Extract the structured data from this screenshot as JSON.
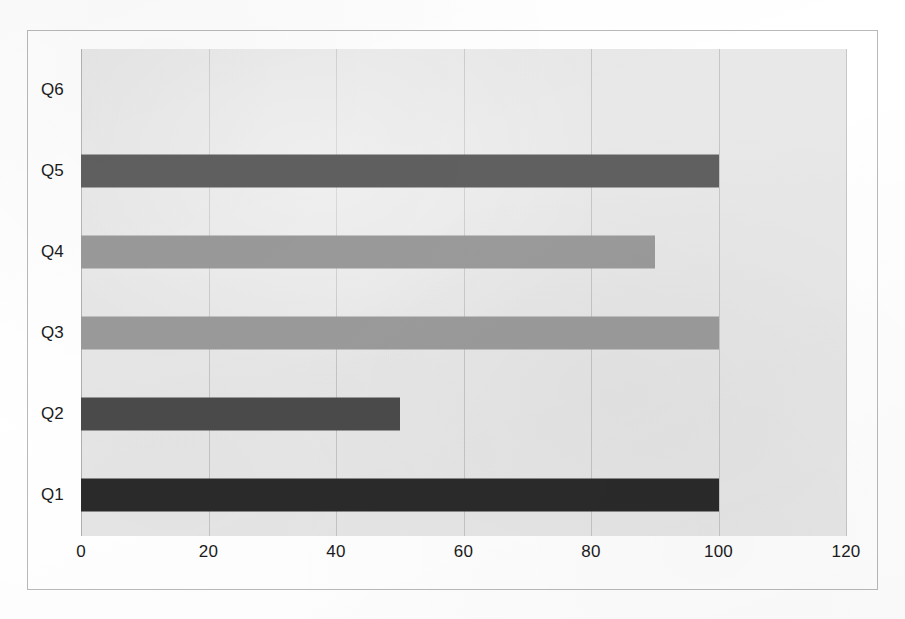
{
  "chart_data": {
    "type": "bar",
    "orientation": "horizontal",
    "title": "",
    "subtitle": "",
    "xlabel": "",
    "ylabel": "",
    "categories": [
      "Q1",
      "Q2",
      "Q3",
      "Q4",
      "Q5",
      "Q6"
    ],
    "values": [
      100,
      50,
      100,
      90,
      100,
      0
    ],
    "series": [
      {
        "name": "",
        "values": [
          100,
          50,
          100,
          90,
          100,
          0
        ]
      }
    ],
    "bar_colors": [
      "#2a2a2a",
      "#4a4a4a",
      "#9a9a9a",
      "#9a9a9a",
      "#606060",
      "#e8e8e8"
    ],
    "xlim": [
      0,
      120
    ],
    "xticks": [
      0,
      20,
      40,
      60,
      80,
      100,
      120
    ],
    "xtick_labels": [
      "0",
      "20",
      "40",
      "60",
      "80",
      "100",
      "120"
    ],
    "ytick_labels": [
      "Q6",
      "Q5",
      "Q4",
      "Q3",
      "Q2",
      "Q1"
    ],
    "grid": true,
    "grid_axis": "x",
    "legend": false,
    "legend_position": "none",
    "plot_background": "#e8e8e8",
    "gridline_color": "#c6c6c6",
    "frame_color": "#b9b9b9",
    "text_color": "#1b1b1b",
    "annotations": []
  },
  "chart": {
    "bands": [
      {
        "label": "Q6",
        "value": 0,
        "color": "#e8e8e8",
        "has_bar": false
      },
      {
        "label": "Q5",
        "value": 100,
        "color": "#606060",
        "has_bar": true
      },
      {
        "label": "Q4",
        "value": 90,
        "color": "#9a9a9a",
        "has_bar": true
      },
      {
        "label": "Q3",
        "value": 100,
        "color": "#9a9a9a",
        "has_bar": true
      },
      {
        "label": "Q2",
        "value": 50,
        "color": "#4a4a4a",
        "has_bar": true
      },
      {
        "label": "Q1",
        "value": 100,
        "color": "#2a2a2a",
        "has_bar": true
      }
    ],
    "ticks": [
      {
        "label": "0",
        "value": 0
      },
      {
        "label": "20",
        "value": 20
      },
      {
        "label": "40",
        "value": 40
      },
      {
        "label": "60",
        "value": 60
      },
      {
        "label": "80",
        "value": 80
      },
      {
        "label": "100",
        "value": 100
      },
      {
        "label": "120",
        "value": 120
      }
    ]
  }
}
